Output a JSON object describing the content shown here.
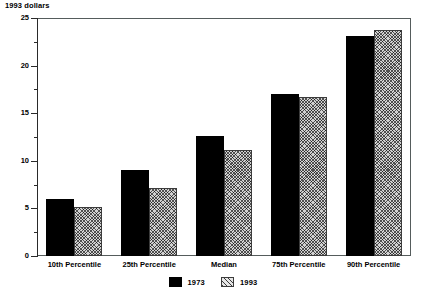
{
  "chart_data": {
    "type": "bar",
    "title": "1993 dollars",
    "xlabel": "",
    "ylabel": "1993 dollars",
    "ylim": [
      0,
      25
    ],
    "yticks": [
      0,
      5,
      10,
      15,
      20,
      25
    ],
    "ytick_labels": [
      "0",
      "5",
      "10",
      "15",
      "20",
      "25"
    ],
    "minor_tick_interval": 2.5,
    "grid": false,
    "legend_position": "bottom-center",
    "categories": [
      "10th Percentile",
      "25th Percentile",
      "Median",
      "75th Percentile",
      "90th Percentile"
    ],
    "series": [
      {
        "name": "1973",
        "style": "solid-black",
        "values": [
          6.0,
          9.0,
          12.6,
          17.0,
          23.1
        ]
      },
      {
        "name": "1993",
        "style": "hatched-gray",
        "values": [
          5.1,
          7.1,
          11.1,
          16.7,
          23.7
        ]
      }
    ]
  },
  "legend": {
    "items": [
      {
        "label": "1973",
        "style": "solid"
      },
      {
        "label": "1993",
        "style": "hatched"
      }
    ]
  },
  "colors": {
    "series_1973": "#000000",
    "series_1993": "#d2d2d2",
    "axis": "#2a2a2a",
    "frame": "#555c5c",
    "background": "#ffffff"
  }
}
